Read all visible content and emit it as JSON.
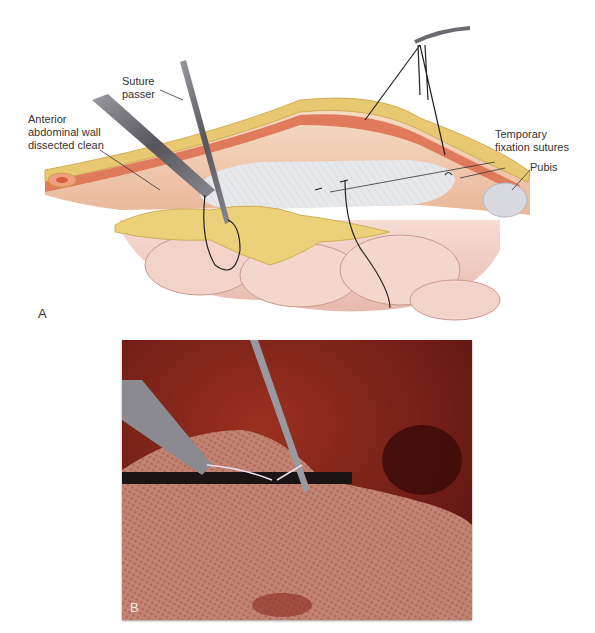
{
  "figure": {
    "panel_a": {
      "letter": "A",
      "labels": {
        "suture_passer": "Suture\npasser",
        "anterior_wall": "Anterior\nabdominal wall\ndissected clean",
        "temporary_sutures": "Temporary\nfixation sutures",
        "pubis": "Pubis"
      }
    },
    "panel_b": {
      "letter": "B"
    },
    "colors": {
      "fat": "#e8c870",
      "muscle": "#e07a5c",
      "peritoneum": "#f0c8b0",
      "mesh": "#e6e8ec",
      "bowel": "#f2cfc6",
      "instrument": "#6a6a70",
      "photo_tissue": "#7a2418",
      "photo_mesh": "#c88a78"
    }
  }
}
